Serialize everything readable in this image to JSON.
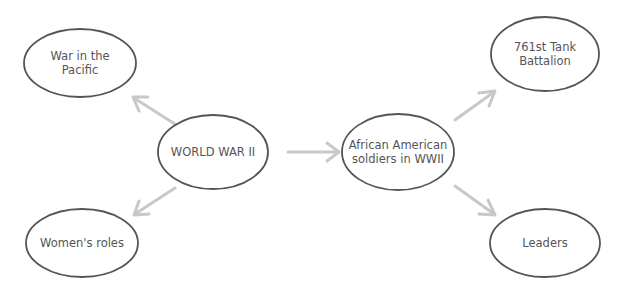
{
  "diagram": {
    "type": "concept-map",
    "colors": {
      "node_stroke": "#555555",
      "node_text": "#555555",
      "arrow": "#c8c8c8",
      "background": "#ffffff"
    },
    "nodes": {
      "war_in_pacific": {
        "label": "War in the\nPacific"
      },
      "world_war_ii": {
        "label": "WORLD WAR II"
      },
      "womens_roles": {
        "label": "Women's roles"
      },
      "african_american_soldiers": {
        "label": "African American\nsoldiers in WWII"
      },
      "tank_battalion": {
        "label": "761st Tank\nBattalion"
      },
      "leaders": {
        "label": "Leaders"
      }
    },
    "edges": [
      {
        "from": "WORLD WAR II",
        "to": "War in the Pacific"
      },
      {
        "from": "WORLD WAR II",
        "to": "Women's roles"
      },
      {
        "from": "WORLD WAR II",
        "to": "African American soldiers in WWII"
      },
      {
        "from": "African American soldiers in WWII",
        "to": "761st Tank Battalion"
      },
      {
        "from": "African American soldiers in WWII",
        "to": "Leaders"
      }
    ]
  }
}
